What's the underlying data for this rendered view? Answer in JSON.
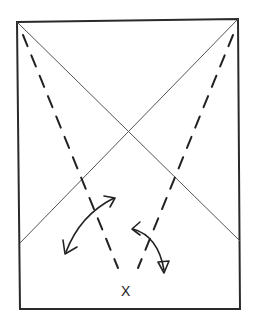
{
  "diagram": {
    "type": "fold-diagram",
    "point_label": "X",
    "elements": {
      "frame": {
        "shape": "rectangle",
        "corners": [
          [
            17,
            22
          ],
          [
            238,
            19
          ],
          [
            240,
            309
          ],
          [
            20,
            309
          ]
        ]
      },
      "diagonals": [
        {
          "from": [
            17,
            22
          ],
          "to": [
            240,
            241
          ]
        },
        {
          "from": [
            238,
            19
          ],
          "to": [
            20,
            243
          ]
        }
      ],
      "fold_lines": [
        {
          "style": "dashed",
          "from": [
            23,
            35
          ],
          "to": [
            118,
            268
          ]
        },
        {
          "style": "dashed",
          "from": [
            233,
            35
          ],
          "to": [
            138,
            268
          ]
        }
      ],
      "arrows": [
        {
          "kind": "double-headed-curved",
          "from": [
            115,
            198
          ],
          "to": [
            64,
            253
          ]
        },
        {
          "kind": "bend-curved",
          "from": [
            133,
            228
          ],
          "to": [
            165,
            272
          ]
        }
      ]
    },
    "colors": {
      "line": "#222222",
      "diagonal": "#555555",
      "background": "#ffffff"
    }
  }
}
